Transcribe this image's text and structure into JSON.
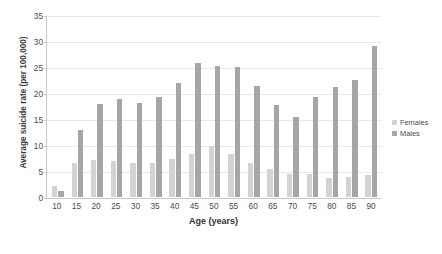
{
  "chart_data": {
    "type": "bar",
    "title": "",
    "xlabel": "Age (years)",
    "ylabel": "Average suicide rate (per 100,000)",
    "categories": [
      "10",
      "15",
      "20",
      "25",
      "30",
      "35",
      "40",
      "45",
      "50",
      "55",
      "60",
      "65",
      "70",
      "75",
      "80",
      "85",
      "90"
    ],
    "series": [
      {
        "name": "Females",
        "color": "#d3d3d3",
        "values": [
          2.2,
          6.6,
          7.1,
          7.0,
          6.6,
          6.6,
          7.4,
          8.4,
          9.8,
          8.4,
          6.6,
          5.5,
          4.4,
          4.5,
          3.7,
          3.8,
          4.2
        ]
      },
      {
        "name": "Males",
        "color": "#a6a6a6",
        "values": [
          1.2,
          13.0,
          18.0,
          19.0,
          18.2,
          19.3,
          22.0,
          25.9,
          25.4,
          25.2,
          21.4,
          17.8,
          15.4,
          19.4,
          21.2,
          22.6,
          29.2
        ]
      }
    ],
    "ylim": [
      0,
      35
    ],
    "ytick_values": [
      "0",
      "5",
      "10",
      "15",
      "20",
      "25",
      "30",
      "35"
    ],
    "ytick_step": 5,
    "grid": true,
    "legend_position": "right"
  },
  "legend": {
    "entries": [
      {
        "label": "Females",
        "swatch": "females"
      },
      {
        "label": "Males",
        "swatch": "males"
      }
    ]
  }
}
